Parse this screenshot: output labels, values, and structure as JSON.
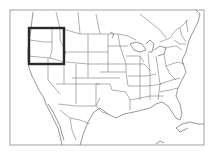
{
  "map": {
    "type": "locator-map",
    "region_shown": "United States (contiguous) with parts of Canada and Mexico",
    "highlight": {
      "label": "Pacific Northwest",
      "states": [
        "Washington",
        "Oregon",
        "Idaho"
      ],
      "box": {
        "x": 29,
        "y": 28,
        "width": 35,
        "height": 36
      },
      "stroke_color": "#2a2a2a"
    },
    "frame": {
      "x": 10,
      "y": 10,
      "width": 194,
      "height": 135,
      "stroke_color": "#8a8a8a"
    },
    "line_color": "#7a7a7a",
    "background": "#ffffff"
  }
}
